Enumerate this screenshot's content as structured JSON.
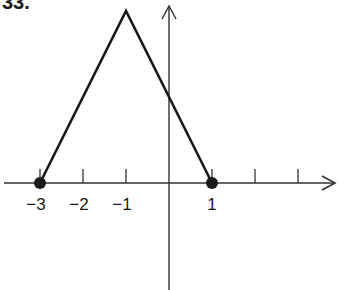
{
  "figure_label": "33.",
  "chart_data": {
    "type": "line",
    "title": "",
    "xlabel": "",
    "ylabel": "",
    "x_tick_labels": [
      "−3",
      "−2",
      "−1",
      "1"
    ],
    "x_ticks": [
      -3,
      -2,
      -1,
      0,
      1,
      2,
      3
    ],
    "xlim": [
      -3.8,
      3.8
    ],
    "ylim": [
      -2.5,
      4.2
    ],
    "grid": false,
    "axes_with_arrows": true,
    "series": [
      {
        "name": "f(x)",
        "x": [
          -3,
          -1,
          1
        ],
        "y": [
          0,
          4,
          0
        ],
        "color": "#1a1a1a"
      }
    ],
    "marked_points": [
      {
        "x": -3,
        "y": 0,
        "style": "filled"
      },
      {
        "x": 1,
        "y": 0,
        "style": "filled"
      }
    ]
  },
  "colors": {
    "ink": "#1a1a1a",
    "axis": "#333333",
    "background": "#ffffff"
  }
}
